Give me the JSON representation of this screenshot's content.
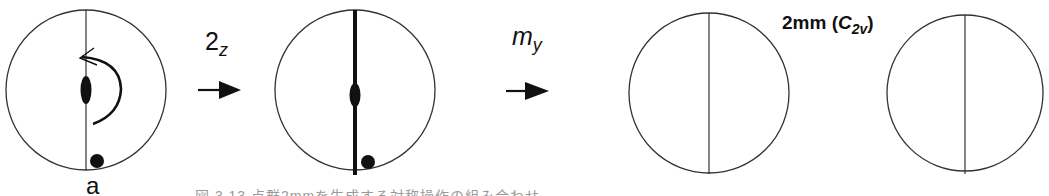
{
  "figure": {
    "panels": [
      {
        "id": "initial",
        "circle": {
          "cx": 86,
          "cy": 90,
          "r": 80
        },
        "mirror_line": "thin",
        "twofold_axis_symbol": "ellipse",
        "rotation_arrow": true,
        "point": {
          "cx": 97,
          "cy": 161,
          "r": 7
        },
        "point_label": "a"
      },
      {
        "id": "after-2z",
        "circle": {
          "cx": 355,
          "cy": 90,
          "r": 80
        },
        "mirror_line": "thick",
        "twofold_axis_symbol": "ellipse",
        "rotation_arrow": false,
        "point": {
          "cx": 368,
          "cy": 162,
          "r": 7
        }
      },
      {
        "id": "after-my",
        "circle": {
          "cx": 709,
          "cy": 93,
          "r": 80
        },
        "mirror_line": "thin"
      },
      {
        "id": "result",
        "circle": {
          "cx": 965,
          "cy": 93,
          "r": 78
        },
        "mirror_line": "thin"
      }
    ],
    "operations": [
      {
        "base": "2",
        "subscript": "z",
        "label_x": 205,
        "label_y": 27,
        "arrow_x1": 198,
        "arrow_x2": 240,
        "arrow_y": 90
      },
      {
        "base": "m",
        "subscript": "y",
        "label_x": 512,
        "label_y": 27,
        "arrow_x1": 506,
        "arrow_x2": 549,
        "arrow_y": 91
      }
    ],
    "group_label": {
      "prefix": "2mm (",
      "symbol": "C",
      "subscript": "2v",
      "suffix": ")"
    },
    "caption": "図 3.13 点群2mmを生成する対称操作の組み合わせ"
  },
  "colors": {
    "stroke": "#333333",
    "fill": "#111111",
    "caption": "#9a9a9a"
  }
}
